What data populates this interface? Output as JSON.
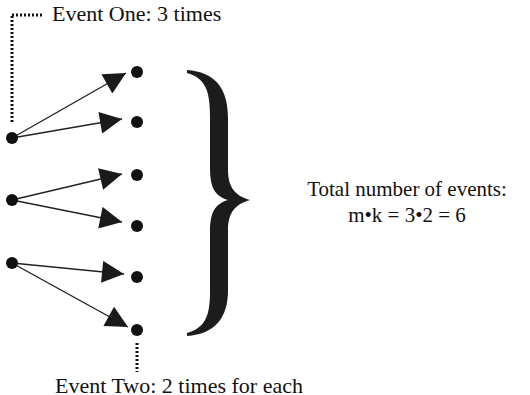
{
  "labels": {
    "event_one": "Event One: 3 times",
    "event_two": "Event Two: 2 times for each",
    "total_title": "Total number of events:",
    "total_formula": "m•k = 3•2 = 6"
  },
  "diagram": {
    "first_stage_nodes": 3,
    "branches_per_node": 2,
    "outcome_nodes": 6,
    "colors": {
      "ink": "#111111",
      "background": "#ffffff"
    }
  }
}
